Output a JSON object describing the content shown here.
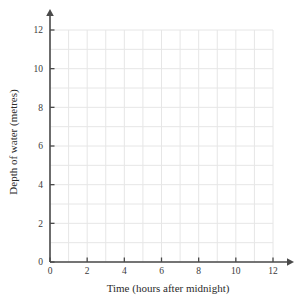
{
  "chart_data": {
    "type": "line",
    "title": "",
    "subtitle": "",
    "xlabel": "Time (hours after midnight)",
    "ylabel": "Depth of water (metres)",
    "xlim": [
      0,
      12
    ],
    "ylim": [
      0,
      12
    ],
    "x_ticks_major": [
      0,
      2,
      4,
      6,
      8,
      10,
      12
    ],
    "y_ticks_major": [
      0,
      2,
      4,
      6,
      8,
      10,
      12
    ],
    "x_tick_labels": [
      "0",
      "2",
      "4",
      "6",
      "8",
      "10",
      "12"
    ],
    "y_tick_labels": [
      "0",
      "2",
      "4",
      "6",
      "8",
      "10",
      "12"
    ],
    "x_gridlines": [
      0,
      1,
      2,
      3,
      4,
      5,
      6,
      7,
      8,
      9,
      10,
      11,
      12
    ],
    "y_gridlines": [
      0,
      1,
      2,
      3,
      4,
      5,
      6,
      7,
      8,
      9,
      10,
      11,
      12
    ],
    "grid": true,
    "legend": null,
    "series": [],
    "annotations": [],
    "colors": {
      "background": "#ffffff",
      "grid": "#e6e6e6",
      "axis": "#4a4a4a",
      "text": "#2b2b2b"
    }
  },
  "axes": {
    "x_axis_name": "x-axis",
    "y_axis_name": "y-axis",
    "x_arrow": true,
    "y_arrow": true
  }
}
